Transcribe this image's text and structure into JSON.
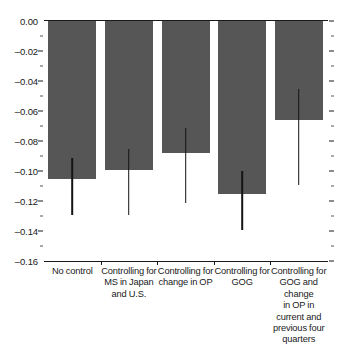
{
  "chart_data": {
    "type": "bar",
    "title": "",
    "xlabel": "",
    "ylabel": "",
    "ylim": [
      -0.16,
      0.0
    ],
    "grid": false,
    "legend": null,
    "orientation": "vertical",
    "bar_color": "#565656",
    "errorbar_color": "#141414",
    "categories": [
      "No control",
      "Controlling for MS in Japan and U.S.",
      "Controlling for change in OP",
      "Controlling for GOG",
      "Controlling for GOG and change in OP in current and previous four quarters"
    ],
    "category_lines": [
      [
        "No control"
      ],
      [
        "Controlling for",
        "MS in Japan",
        "and U.S."
      ],
      [
        "Controlling for",
        "change in OP"
      ],
      [
        "Controlling for",
        "GOG"
      ],
      [
        "Controlling for",
        "GOG and",
        "change",
        "in OP in",
        "current and",
        "previous four",
        "quarters"
      ]
    ],
    "values": [
      -0.105,
      -0.099,
      -0.088,
      -0.115,
      -0.066
    ],
    "error_high": [
      -0.091,
      -0.085,
      -0.071,
      -0.1,
      -0.045
    ],
    "error_low": [
      -0.129,
      -0.129,
      -0.121,
      -0.139,
      -0.109
    ],
    "ytick_labels": [
      "0.00",
      "–0.02",
      "–0.04",
      "–0.06",
      "–0.08",
      "–0.10",
      "–0.12",
      "–0.14",
      "–0.16"
    ],
    "ytick_values": [
      0.0,
      -0.02,
      -0.04,
      -0.06,
      -0.08,
      -0.1,
      -0.12,
      -0.14,
      -0.16
    ],
    "yminor_values": [
      -0.01,
      -0.03,
      -0.05,
      -0.07,
      -0.09,
      -0.11,
      -0.13,
      -0.15
    ]
  }
}
